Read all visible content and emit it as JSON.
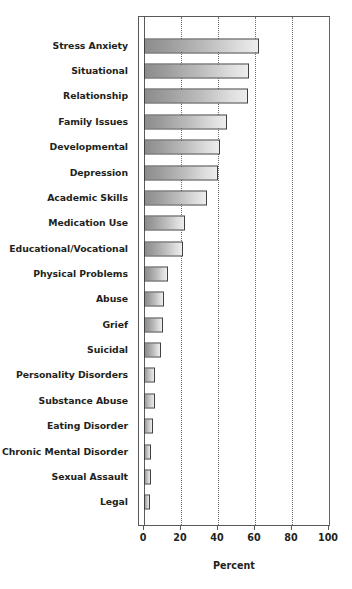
{
  "chart_data": {
    "type": "bar",
    "orientation": "horizontal",
    "title": "",
    "xlabel": "Percent",
    "ylabel": "",
    "xlim": [
      0,
      100
    ],
    "xticks": [
      0,
      20,
      40,
      60,
      80,
      100
    ],
    "grid": "vertical-dotted",
    "legend": "none",
    "categories": [
      "Stress Anxiety",
      "Situational",
      "Relationship",
      "Family Issues",
      "Developmental",
      "Depression",
      "Academic Skills",
      "Medication Use",
      "Educational/Vocational",
      "Physical Problems",
      "Abuse",
      "Grief",
      "Suicidal",
      "Personality Disorders",
      "Substance Abuse",
      "Eating Disorder",
      "Chronic Mental Disorder",
      "Sexual Assault",
      "Legal"
    ],
    "values": [
      62,
      57,
      56,
      45,
      41,
      40,
      34,
      22,
      21,
      13,
      11,
      10,
      9,
      6,
      6,
      5,
      4,
      4,
      3
    ]
  },
  "style": {
    "bar_gradient_start": "#8d8d8d",
    "bar_gradient_end": "#ededed",
    "bar_border": "#404041",
    "axis_color": "#58595b",
    "grid_color": "#6d6e70",
    "text_color": "#231f20",
    "background": "#ffffff"
  }
}
